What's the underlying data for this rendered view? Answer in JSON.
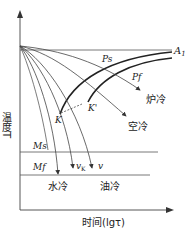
{
  "diagram": {
    "axes": {
      "y_label": "温度T",
      "x_label": "时间(lgτ)"
    },
    "lines": {
      "A1": "A",
      "A1_sub": "1",
      "Ms": "Ms",
      "Mf": "Mf"
    },
    "curve_labels": {
      "Ps": "Ps",
      "Pf": "Pf",
      "K": "K",
      "K_prime": "K'"
    },
    "cooling_labels": {
      "furnace": "炉冷",
      "air": "空冷",
      "water": "水冷",
      "oil": "油冷",
      "vk": "v",
      "vk_sub": "K",
      "v": "v"
    },
    "colors": {
      "line": "#444444",
      "bold": "#222222",
      "background": "#ffffff"
    }
  }
}
